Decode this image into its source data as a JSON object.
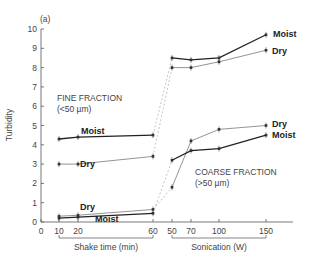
{
  "chart_data": {
    "type": "line",
    "panel_label": "(a)",
    "title": "",
    "ylabel": "Turbidity",
    "ylim": [
      0,
      10
    ],
    "yticks": [
      0,
      1,
      2,
      3,
      4,
      5,
      6,
      7,
      8,
      9,
      10
    ],
    "grid": false,
    "x_segments": [
      {
        "name": "Shake time (min)",
        "ticks": [
          0,
          10,
          20,
          60
        ]
      },
      {
        "name": "Sonication (W)",
        "ticks": [
          50,
          70,
          100,
          150
        ]
      }
    ],
    "x": [
      "10 min",
      "20 min",
      "60 min",
      "50 W",
      "70 W",
      "100 W",
      "150 W"
    ],
    "groups": [
      {
        "name": "FINE FRACTION",
        "subtitle": "(<50 µm)"
      },
      {
        "name": "COARSE FRACTION",
        "subtitle": "(>50 µm)"
      }
    ],
    "series": [
      {
        "name": "Moist",
        "group": "FINE FRACTION",
        "style": "bold",
        "values": [
          4.3,
          4.4,
          4.5,
          8.5,
          8.4,
          8.5,
          9.7
        ]
      },
      {
        "name": "Dry",
        "group": "FINE FRACTION",
        "style": "light",
        "values": [
          3.0,
          3.0,
          3.4,
          8.0,
          8.0,
          8.3,
          8.9
        ]
      },
      {
        "name": "Dry",
        "group": "COARSE FRACTION",
        "style": "light",
        "values": [
          0.3,
          0.35,
          0.65,
          1.8,
          4.2,
          4.8,
          5.0
        ]
      },
      {
        "name": "Moist",
        "group": "COARSE FRACTION",
        "style": "bold",
        "values": [
          0.2,
          0.25,
          0.45,
          3.2,
          3.7,
          3.8,
          4.5
        ]
      }
    ]
  }
}
